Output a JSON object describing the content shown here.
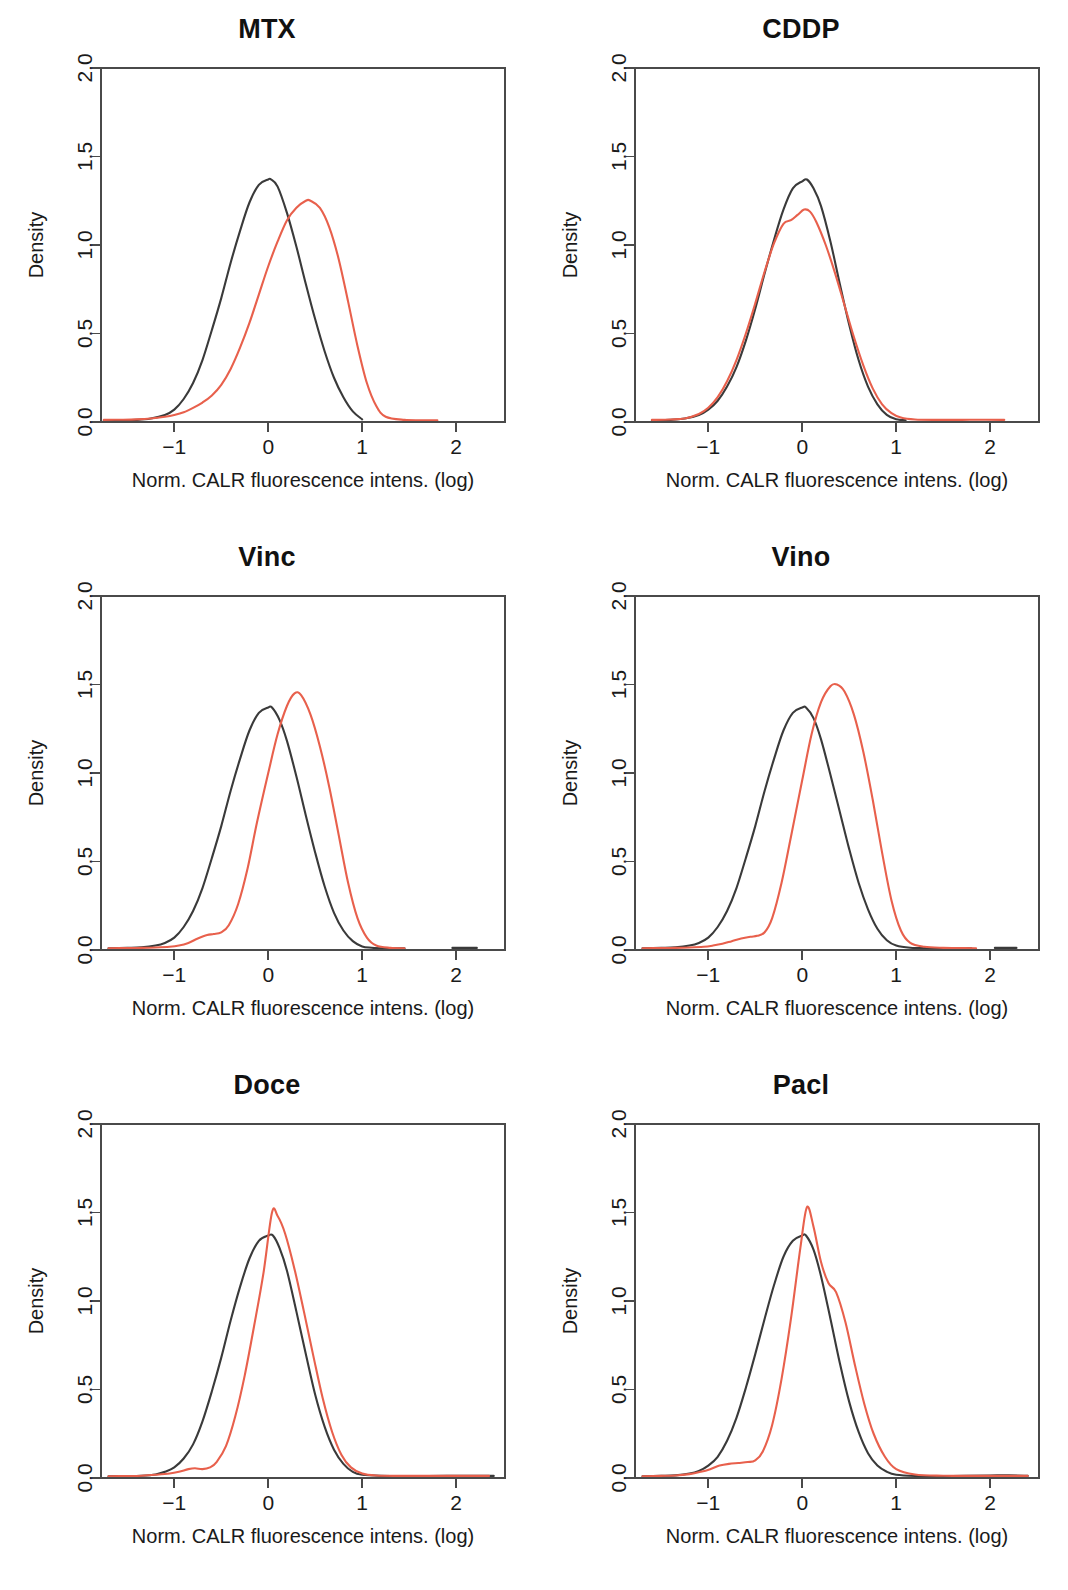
{
  "figure": {
    "columns": 2,
    "rows": 3,
    "background": "#ffffff"
  },
  "axis": {
    "xlabel": "Norm. CALR fluorescence intens. (log)",
    "ylabel": "Density",
    "xticks": [
      -1,
      0,
      1,
      2
    ],
    "xtick_labels": [
      "−1",
      "0",
      "1",
      "2"
    ],
    "yticks": [
      0.0,
      0.5,
      1.0,
      1.5,
      2.0
    ],
    "ytick_labels": [
      "0.0",
      "0.5",
      "1.0",
      "1.5",
      "2.0"
    ],
    "xlim": [
      -1.78,
      2.52
    ],
    "ylim": [
      0.0,
      2.0
    ]
  },
  "series_styles": {
    "control": {
      "name": "control",
      "color": "#3a3a3a"
    },
    "treated": {
      "name": "treated",
      "color": "#e8604c"
    }
  },
  "chart_data": [
    {
      "type": "line",
      "title": "MTX",
      "xlabel": "Norm. CALR fluorescence intens. (log)",
      "ylabel": "Density",
      "xlim": [
        -1.78,
        2.52
      ],
      "ylim": [
        0.0,
        2.0
      ],
      "grid": false,
      "legend": "none",
      "series": [
        {
          "name": "control",
          "color": "#3a3a3a",
          "x": [
            -1.75,
            -1.55,
            -1.4,
            -1.25,
            -1.1,
            -1.0,
            -0.9,
            -0.8,
            -0.7,
            -0.6,
            -0.5,
            -0.4,
            -0.3,
            -0.2,
            -0.1,
            0.0,
            0.03,
            0.1,
            0.2,
            0.3,
            0.4,
            0.5,
            0.6,
            0.7,
            0.8,
            0.9,
            1.0
          ],
          "values": [
            0.01,
            0.01,
            0.012,
            0.02,
            0.04,
            0.07,
            0.13,
            0.22,
            0.35,
            0.52,
            0.7,
            0.9,
            1.08,
            1.24,
            1.34,
            1.37,
            1.37,
            1.33,
            1.18,
            0.99,
            0.78,
            0.58,
            0.4,
            0.25,
            0.14,
            0.06,
            0.015
          ]
        },
        {
          "name": "treated",
          "color": "#e8604c",
          "x": [
            -1.75,
            -1.55,
            -1.4,
            -1.25,
            -1.1,
            -1.0,
            -0.9,
            -0.8,
            -0.7,
            -0.6,
            -0.5,
            -0.4,
            -0.3,
            -0.2,
            -0.1,
            0.0,
            0.1,
            0.2,
            0.3,
            0.4,
            0.45,
            0.55,
            0.65,
            0.75,
            0.85,
            0.95,
            1.05,
            1.15,
            1.25,
            1.45,
            1.65,
            1.8
          ],
          "values": [
            0.012,
            0.013,
            0.015,
            0.02,
            0.03,
            0.04,
            0.055,
            0.08,
            0.11,
            0.15,
            0.21,
            0.3,
            0.42,
            0.56,
            0.72,
            0.88,
            1.02,
            1.14,
            1.21,
            1.25,
            1.25,
            1.21,
            1.1,
            0.92,
            0.68,
            0.43,
            0.22,
            0.09,
            0.03,
            0.012,
            0.01,
            0.01
          ]
        }
      ]
    },
    {
      "type": "line",
      "title": "CDDP",
      "xlabel": "Norm. CALR fluorescence intens. (log)",
      "ylabel": "Density",
      "xlim": [
        -1.78,
        2.52
      ],
      "ylim": [
        0.0,
        2.0
      ],
      "grid": false,
      "legend": "none",
      "series": [
        {
          "name": "control",
          "color": "#3a3a3a",
          "x": [
            -1.6,
            -1.4,
            -1.25,
            -1.1,
            -1.0,
            -0.9,
            -0.8,
            -0.7,
            -0.6,
            -0.5,
            -0.4,
            -0.3,
            -0.2,
            -0.1,
            0.0,
            0.05,
            0.12,
            0.2,
            0.3,
            0.4,
            0.5,
            0.6,
            0.7,
            0.8,
            0.9,
            1.0,
            1.1
          ],
          "values": [
            0.01,
            0.012,
            0.02,
            0.04,
            0.07,
            0.12,
            0.2,
            0.31,
            0.46,
            0.64,
            0.84,
            1.03,
            1.2,
            1.32,
            1.36,
            1.37,
            1.32,
            1.22,
            1.02,
            0.78,
            0.55,
            0.35,
            0.2,
            0.1,
            0.04,
            0.015,
            0.01
          ]
        },
        {
          "name": "treated",
          "color": "#e8604c",
          "x": [
            -1.6,
            -1.4,
            -1.25,
            -1.1,
            -1.0,
            -0.9,
            -0.8,
            -0.7,
            -0.6,
            -0.5,
            -0.4,
            -0.3,
            -0.2,
            -0.12,
            -0.05,
            0.02,
            0.08,
            0.15,
            0.25,
            0.35,
            0.45,
            0.55,
            0.65,
            0.75,
            0.85,
            0.95,
            1.05,
            1.2,
            1.45,
            1.7,
            1.95,
            2.15
          ],
          "values": [
            0.012,
            0.014,
            0.02,
            0.045,
            0.08,
            0.14,
            0.23,
            0.35,
            0.5,
            0.67,
            0.85,
            1.01,
            1.12,
            1.14,
            1.17,
            1.2,
            1.19,
            1.13,
            1.0,
            0.84,
            0.66,
            0.48,
            0.32,
            0.19,
            0.1,
            0.05,
            0.025,
            0.014,
            0.012,
            0.012,
            0.013,
            0.012
          ]
        }
      ]
    },
    {
      "type": "line",
      "title": "Vinc",
      "xlabel": "Norm. CALR fluorescence intens. (log)",
      "ylabel": "Density",
      "xlim": [
        -1.78,
        2.52
      ],
      "ylim": [
        0.0,
        2.0
      ],
      "grid": false,
      "legend": "none",
      "series": [
        {
          "name": "control",
          "color": "#3a3a3a",
          "x": [
            -1.7,
            -1.5,
            -1.35,
            -1.2,
            -1.1,
            -1.0,
            -0.9,
            -0.8,
            -0.7,
            -0.6,
            -0.5,
            -0.4,
            -0.3,
            -0.2,
            -0.1,
            0.0,
            0.04,
            0.12,
            0.2,
            0.3,
            0.4,
            0.5,
            0.6,
            0.7,
            0.8,
            0.9,
            1.0,
            1.1,
            1.25,
            1.45
          ],
          "values": [
            0.01,
            0.012,
            0.015,
            0.025,
            0.04,
            0.07,
            0.13,
            0.22,
            0.35,
            0.52,
            0.7,
            0.9,
            1.08,
            1.24,
            1.34,
            1.37,
            1.37,
            1.3,
            1.18,
            0.98,
            0.76,
            0.55,
            0.36,
            0.21,
            0.11,
            0.05,
            0.02,
            0.013,
            0.01,
            0.01
          ]
        },
        {
          "name": "treated",
          "color": "#e8604c",
          "x": [
            -1.7,
            -1.5,
            -1.35,
            -1.2,
            -1.05,
            -0.95,
            -0.85,
            -0.75,
            -0.65,
            -0.58,
            -0.5,
            -0.42,
            -0.32,
            -0.22,
            -0.12,
            0.0,
            0.1,
            0.2,
            0.28,
            0.35,
            0.45,
            0.55,
            0.65,
            0.75,
            0.85,
            0.95,
            1.05,
            1.15,
            1.3,
            1.45
          ],
          "values": [
            0.01,
            0.011,
            0.012,
            0.014,
            0.018,
            0.025,
            0.04,
            0.065,
            0.085,
            0.09,
            0.1,
            0.14,
            0.26,
            0.46,
            0.72,
            1.0,
            1.22,
            1.38,
            1.45,
            1.44,
            1.33,
            1.15,
            0.92,
            0.65,
            0.38,
            0.18,
            0.07,
            0.025,
            0.012,
            0.01
          ]
        },
        {
          "name": "control",
          "color": "#3a3a3a",
          "segment": "outlier-tail",
          "x": [
            1.96,
            2.22
          ],
          "values": [
            0.012,
            0.012
          ]
        }
      ]
    },
    {
      "type": "line",
      "title": "Vino",
      "xlabel": "Norm. CALR fluorescence intens. (log)",
      "ylabel": "Density",
      "xlim": [
        -1.78,
        2.52
      ],
      "ylim": [
        0.0,
        2.0
      ],
      "grid": false,
      "legend": "none",
      "series": [
        {
          "name": "control",
          "color": "#3a3a3a",
          "x": [
            -1.7,
            -1.5,
            -1.35,
            -1.2,
            -1.1,
            -1.0,
            -0.9,
            -0.8,
            -0.7,
            -0.6,
            -0.5,
            -0.4,
            -0.3,
            -0.2,
            -0.1,
            0.0,
            0.04,
            0.12,
            0.2,
            0.3,
            0.4,
            0.5,
            0.6,
            0.7,
            0.8,
            0.9,
            1.0,
            1.15,
            1.35,
            1.6,
            1.8
          ],
          "values": [
            0.01,
            0.012,
            0.015,
            0.025,
            0.04,
            0.07,
            0.13,
            0.22,
            0.35,
            0.52,
            0.7,
            0.9,
            1.08,
            1.24,
            1.34,
            1.37,
            1.37,
            1.31,
            1.19,
            0.99,
            0.78,
            0.57,
            0.38,
            0.23,
            0.12,
            0.055,
            0.025,
            0.013,
            0.011,
            0.011,
            0.01
          ]
        },
        {
          "name": "treated",
          "color": "#e8604c",
          "x": [
            -1.7,
            -1.5,
            -1.35,
            -1.2,
            -1.05,
            -0.95,
            -0.85,
            -0.75,
            -0.65,
            -0.55,
            -0.48,
            -0.4,
            -0.32,
            -0.22,
            -0.12,
            0.0,
            0.1,
            0.2,
            0.3,
            0.37,
            0.45,
            0.55,
            0.65,
            0.75,
            0.85,
            0.95,
            1.05,
            1.15,
            1.3,
            1.5,
            1.7,
            1.85
          ],
          "values": [
            0.01,
            0.011,
            0.012,
            0.014,
            0.018,
            0.025,
            0.035,
            0.05,
            0.065,
            0.075,
            0.08,
            0.1,
            0.18,
            0.38,
            0.64,
            0.96,
            1.22,
            1.4,
            1.49,
            1.5,
            1.46,
            1.33,
            1.12,
            0.85,
            0.55,
            0.28,
            0.11,
            0.04,
            0.018,
            0.012,
            0.011,
            0.01
          ]
        },
        {
          "name": "control",
          "color": "#3a3a3a",
          "segment": "outlier-tail",
          "x": [
            2.05,
            2.28
          ],
          "values": [
            0.012,
            0.012
          ]
        }
      ]
    },
    {
      "type": "line",
      "title": "Doce",
      "xlabel": "Norm. CALR fluorescence intens. (log)",
      "ylabel": "Density",
      "xlim": [
        -1.78,
        2.52
      ],
      "ylim": [
        0.0,
        2.0
      ],
      "grid": false,
      "legend": "none",
      "series": [
        {
          "name": "control",
          "color": "#3a3a3a",
          "x": [
            -1.7,
            -1.5,
            -1.35,
            -1.2,
            -1.1,
            -1.0,
            -0.9,
            -0.8,
            -0.7,
            -0.6,
            -0.5,
            -0.4,
            -0.3,
            -0.2,
            -0.1,
            0.0,
            0.05,
            0.12,
            0.2,
            0.3,
            0.4,
            0.5,
            0.6,
            0.7,
            0.8,
            0.9,
            1.0,
            1.2,
            1.5,
            1.9,
            2.2,
            2.4
          ],
          "values": [
            0.01,
            0.011,
            0.013,
            0.02,
            0.035,
            0.06,
            0.11,
            0.19,
            0.32,
            0.49,
            0.68,
            0.89,
            1.08,
            1.24,
            1.34,
            1.37,
            1.37,
            1.3,
            1.17,
            0.94,
            0.7,
            0.47,
            0.29,
            0.16,
            0.08,
            0.035,
            0.018,
            0.012,
            0.011,
            0.012,
            0.013,
            0.012
          ]
        },
        {
          "name": "treated",
          "color": "#e8604c",
          "x": [
            -1.7,
            -1.5,
            -1.35,
            -1.2,
            -1.05,
            -0.95,
            -0.85,
            -0.78,
            -0.7,
            -0.62,
            -0.55,
            -0.45,
            -0.35,
            -0.25,
            -0.15,
            -0.05,
            0.04,
            0.1,
            0.18,
            0.28,
            0.38,
            0.48,
            0.58,
            0.68,
            0.78,
            0.88,
            1.0,
            1.15,
            1.4,
            1.7,
            2.0,
            2.35
          ],
          "values": [
            0.01,
            0.011,
            0.013,
            0.018,
            0.025,
            0.035,
            0.05,
            0.055,
            0.05,
            0.06,
            0.09,
            0.18,
            0.35,
            0.58,
            0.86,
            1.16,
            1.5,
            1.48,
            1.38,
            1.18,
            0.94,
            0.69,
            0.45,
            0.26,
            0.13,
            0.06,
            0.025,
            0.014,
            0.012,
            0.012,
            0.012,
            0.012
          ]
        }
      ]
    },
    {
      "type": "line",
      "title": "Pacl",
      "xlabel": "Norm. CALR fluorescence intens. (log)",
      "ylabel": "Density",
      "xlim": [
        -1.78,
        2.52
      ],
      "ylim": [
        0.0,
        2.0
      ],
      "grid": false,
      "legend": "none",
      "series": [
        {
          "name": "control",
          "color": "#3a3a3a",
          "x": [
            -1.7,
            -1.5,
            -1.35,
            -1.2,
            -1.1,
            -1.0,
            -0.9,
            -0.8,
            -0.7,
            -0.6,
            -0.5,
            -0.4,
            -0.3,
            -0.2,
            -0.1,
            0.0,
            0.04,
            0.12,
            0.2,
            0.3,
            0.4,
            0.5,
            0.6,
            0.7,
            0.8,
            0.9,
            1.0,
            1.2,
            1.6,
            2.0,
            2.2,
            2.4
          ],
          "values": [
            0.01,
            0.012,
            0.015,
            0.025,
            0.04,
            0.07,
            0.12,
            0.21,
            0.34,
            0.51,
            0.7,
            0.9,
            1.09,
            1.25,
            1.34,
            1.37,
            1.37,
            1.29,
            1.14,
            0.9,
            0.65,
            0.43,
            0.26,
            0.14,
            0.07,
            0.035,
            0.018,
            0.012,
            0.011,
            0.014,
            0.015,
            0.012
          ]
        },
        {
          "name": "treated",
          "color": "#e8604c",
          "x": [
            -1.7,
            -1.5,
            -1.35,
            -1.2,
            -1.08,
            -0.98,
            -0.88,
            -0.78,
            -0.68,
            -0.58,
            -0.5,
            -0.42,
            -0.32,
            -0.22,
            -0.12,
            -0.02,
            0.05,
            0.12,
            0.2,
            0.28,
            0.36,
            0.46,
            0.56,
            0.66,
            0.76,
            0.88,
            1.0,
            1.2,
            1.5,
            1.85,
            2.15,
            2.4
          ],
          "values": [
            0.01,
            0.012,
            0.014,
            0.022,
            0.035,
            0.05,
            0.07,
            0.08,
            0.085,
            0.09,
            0.1,
            0.15,
            0.3,
            0.56,
            0.9,
            1.3,
            1.53,
            1.42,
            1.22,
            1.1,
            1.05,
            0.88,
            0.64,
            0.42,
            0.25,
            0.12,
            0.05,
            0.02,
            0.013,
            0.012,
            0.012,
            0.012
          ]
        }
      ]
    }
  ]
}
